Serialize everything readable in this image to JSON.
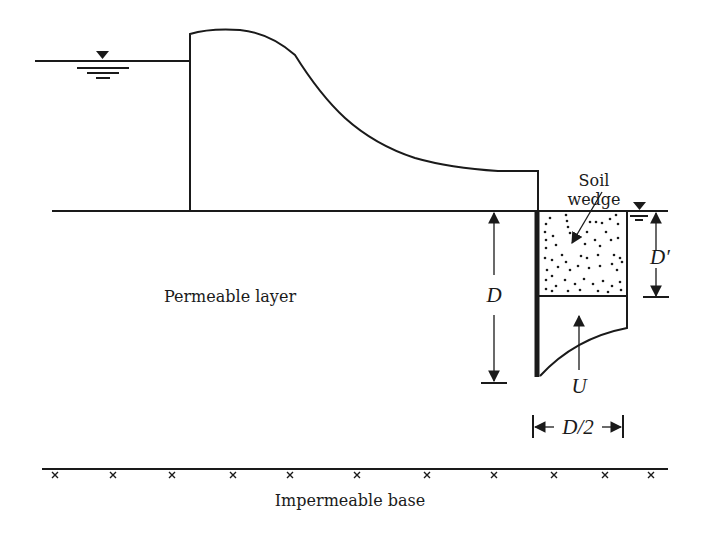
{
  "diagram": {
    "labels": {
      "soil_wedge_line1": "Soil",
      "soil_wedge_line2": "wedge",
      "permeable_layer": "Permeable layer",
      "impermeable_base": "Impermeable base",
      "dim_D": "D",
      "dim_D_prime": "D′",
      "dim_D_half": "D/2",
      "uplift_U": "U"
    },
    "symbols": {
      "upstream_water_level": "water-level-triangle-icon",
      "downstream_water_level": "water-level-triangle-icon",
      "base_hatch": "x-mark"
    },
    "base_marks_count": 11,
    "colors": {
      "ink": "#1a1a1a",
      "background": "#ffffff"
    }
  }
}
